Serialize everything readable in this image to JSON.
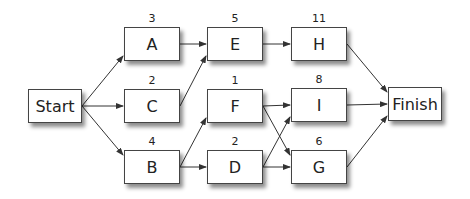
{
  "diagram": {
    "type": "activity-network",
    "nodes": [
      {
        "id": "start",
        "label": "Start",
        "duration": null,
        "x": 28,
        "y": 89,
        "w": 54,
        "h": 34
      },
      {
        "id": "A",
        "label": "A",
        "duration": "3",
        "x": 124,
        "y": 27,
        "w": 56,
        "h": 34
      },
      {
        "id": "C",
        "label": "C",
        "duration": "2",
        "x": 124,
        "y": 89,
        "w": 56,
        "h": 34
      },
      {
        "id": "B",
        "label": "B",
        "duration": "4",
        "x": 124,
        "y": 150,
        "w": 56,
        "h": 34
      },
      {
        "id": "E",
        "label": "E",
        "duration": "5",
        "x": 207,
        "y": 27,
        "w": 56,
        "h": 34
      },
      {
        "id": "F",
        "label": "F",
        "duration": "1",
        "x": 207,
        "y": 89,
        "w": 56,
        "h": 34
      },
      {
        "id": "D",
        "label": "D",
        "duration": "2",
        "x": 207,
        "y": 150,
        "w": 56,
        "h": 34
      },
      {
        "id": "H",
        "label": "H",
        "duration": "11",
        "x": 291,
        "y": 27,
        "w": 56,
        "h": 34
      },
      {
        "id": "I",
        "label": "I",
        "duration": "8",
        "x": 291,
        "y": 88,
        "w": 56,
        "h": 34
      },
      {
        "id": "G",
        "label": "G",
        "duration": "6",
        "x": 291,
        "y": 150,
        "w": 56,
        "h": 34
      },
      {
        "id": "finish",
        "label": "Finish",
        "duration": null,
        "x": 388,
        "y": 87,
        "w": 54,
        "h": 34
      }
    ],
    "edges": [
      [
        "start",
        "A"
      ],
      [
        "start",
        "C"
      ],
      [
        "start",
        "B"
      ],
      [
        "A",
        "E"
      ],
      [
        "C",
        "E"
      ],
      [
        "B",
        "F"
      ],
      [
        "B",
        "D"
      ],
      [
        "E",
        "H"
      ],
      [
        "F",
        "I"
      ],
      [
        "F",
        "G"
      ],
      [
        "D",
        "I"
      ],
      [
        "D",
        "G"
      ],
      [
        "H",
        "finish"
      ],
      [
        "I",
        "finish"
      ],
      [
        "G",
        "finish"
      ]
    ]
  }
}
